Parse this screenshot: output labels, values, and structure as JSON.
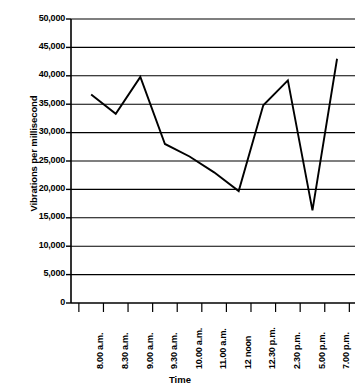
{
  "chart_data": {
    "type": "line",
    "title": "",
    "xlabel": "Time",
    "ylabel": "Vibrations per millisecond",
    "categories": [
      "8.00 a.m.",
      "8.30 a.m.",
      "9.00 a.m.",
      "9.30 a.m.",
      "10.00 a.m.",
      "11.00 a.m.",
      "12 noon",
      "12.30 p.m.",
      "2.30 p.m.",
      "5.00 p.m.",
      "7.00 p.m."
    ],
    "values": [
      36700,
      33300,
      39800,
      28000,
      25800,
      23000,
      19700,
      34800,
      39200,
      16300,
      43000
    ],
    "ylim": [
      0,
      50000
    ],
    "ytick_values": [
      0,
      5000,
      10000,
      15000,
      20000,
      25000,
      30000,
      35000,
      40000,
      45000,
      50000
    ],
    "ytick_labels": [
      "0",
      "5,000",
      "10,000",
      "15,000",
      "20,000",
      "25,000",
      "30,000",
      "35,000",
      "40,000",
      "45,000",
      "50,000"
    ],
    "grid": true,
    "grid_axis": "y",
    "legend": false,
    "legend_position": "none",
    "line_color": "#000000",
    "grid_color": "#000000",
    "axis_color": "#000000",
    "background_color": "#ffffff",
    "markers": false
  }
}
